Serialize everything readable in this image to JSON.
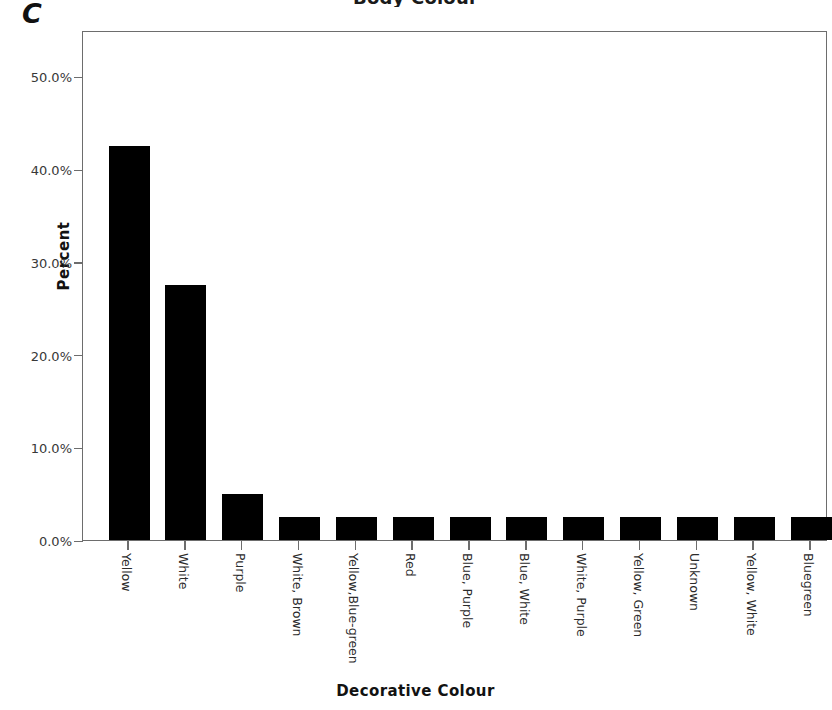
{
  "panel": {
    "letter": "C"
  },
  "chart_data": {
    "type": "bar",
    "title": "Body Colour",
    "xlabel": "Decorative Colour",
    "ylabel": "Percent",
    "ylim": [
      0,
      55
    ],
    "grid": false,
    "legend": null,
    "ytick_labels": [
      "50.0%",
      "40.0%",
      "30.0%",
      "20.0%",
      "10.0%",
      "0.0%"
    ],
    "ytick_values": [
      50,
      40,
      30,
      20,
      10,
      0
    ],
    "yaxis_unit": "percent",
    "bar_color": "#000000",
    "frame_color": "#6d6d6d",
    "categories": [
      "Yellow",
      "White",
      "Purple",
      "White, Brown",
      "Yellow,Blue-green",
      "Red",
      "Blue, Purple",
      "Blue, White",
      "White, Purple",
      "Yellow, Green",
      "Unknown",
      "Yellow, White",
      "Bluegreen"
    ],
    "values": [
      42.5,
      27.5,
      5.0,
      2.5,
      2.5,
      2.5,
      2.5,
      2.5,
      2.5,
      2.5,
      2.5,
      2.5,
      2.5
    ]
  }
}
